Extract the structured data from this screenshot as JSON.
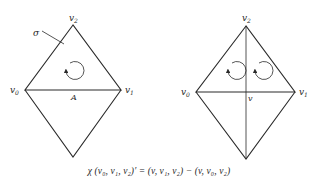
{
  "figure": {
    "left_diagram": {
      "vertices": {
        "top": {
          "label": "v",
          "sub": "2"
        },
        "left": {
          "label": "v",
          "sub": "0"
        },
        "right": {
          "label": "v",
          "sub": "1"
        }
      },
      "simplex_label": "σ",
      "edge_label": "A",
      "orientation_arrows": 1
    },
    "right_diagram": {
      "vertices": {
        "top": {
          "label": "v",
          "sub": "2"
        },
        "left": {
          "label": "v",
          "sub": "0"
        },
        "right": {
          "label": "v",
          "sub": "1"
        }
      },
      "center_label": "v",
      "orientation_arrows": 2
    },
    "formula": "χ (v₀, v₁, v₂)′ = (v, v₁, v₂) − (v, v₀, v₂)"
  }
}
